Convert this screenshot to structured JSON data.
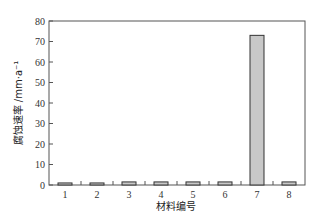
{
  "chart_data": {
    "type": "bar",
    "title": "",
    "xlabel": "材料编号",
    "ylabel": "腐蚀速率 /mm·a⁻¹",
    "categories": [
      "1",
      "2",
      "3",
      "4",
      "5",
      "6",
      "7",
      "8"
    ],
    "values": [
      1.0,
      1.0,
      1.5,
      1.5,
      1.5,
      1.5,
      73,
      1.5
    ],
    "ylim": [
      0,
      80
    ],
    "yticks": [
      0,
      10,
      20,
      30,
      40,
      50,
      60,
      70,
      80
    ],
    "grid": false,
    "legend": null,
    "bar_color": "#c8c8c8",
    "bar_edge_color": "#333333"
  }
}
